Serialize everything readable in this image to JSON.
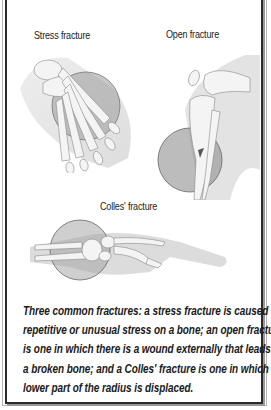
{
  "figure": {
    "panels": [
      {
        "id": "stress",
        "label": "Stress fracture",
        "subject": "foot-bones-icon"
      },
      {
        "id": "open",
        "label": "Open fracture",
        "subject": "knee-leg-bones-icon"
      },
      {
        "id": "colles",
        "label": "Colles' fracture",
        "subject": "wrist-hand-bones-icon"
      }
    ],
    "caption_lines": [
      "Three common fractures: a stress fracture is caused by",
      "repetitive or unusual stress on a bone; an open fracture",
      "is one in which there is a wound externally that leads to",
      "a broken bone; and a Colles' fracture is one in which the",
      "lower part of the radius is displaced."
    ],
    "colors": {
      "border": "#2a2a2a",
      "bone": "#f2f2f2",
      "skin": "#d9d9d9",
      "lens": "#8c8c8c"
    }
  }
}
